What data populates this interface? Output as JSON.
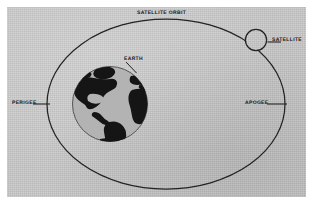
{
  "figure": {
    "title": "SATELLITE ORBIT",
    "type": "orbital-mechanics-diagram",
    "page_background": "#ffffff",
    "panel_background": "#c9c9c9",
    "ink_color": "#1b1b1b"
  },
  "labels": {
    "orbit": "SATELLITE ORBIT",
    "satellite": "SATELLITE",
    "apogee": "APOGEE",
    "perigee": "PERIGEE",
    "earth": "EARTH"
  },
  "elements": {
    "orbit_path": {
      "shape": "ellipse",
      "center_x": 166,
      "center_y": 104,
      "radius_x": 119,
      "radius_y": 85,
      "stroke": "#232323",
      "stroke_width": 1.2
    },
    "earth": {
      "shape": "circle",
      "center_x": 110,
      "center_y": 104,
      "radius": 38,
      "ocean_fill": "#b4b4b4",
      "land_fill": "#141414",
      "stroke": "#4a4a4a"
    },
    "satellite": {
      "shape": "circle",
      "center_x": 256,
      "center_y": 40,
      "radius": 11,
      "fill": "none",
      "stroke": "#232323"
    },
    "perigee_point": {
      "x": 47,
      "y": 104
    },
    "apogee_point": {
      "x": 285,
      "y": 104
    }
  },
  "leader_lines": {
    "satellite": {
      "x1": 267,
      "y1": 42,
      "x2": 281,
      "y2": 42
    },
    "apogee": {
      "x1": 267,
      "y1": 104,
      "x2": 288,
      "y2": 104
    },
    "perigee": {
      "x1": 33,
      "y1": 104,
      "x2": 50,
      "y2": 104
    },
    "earth": {
      "x1": 127,
      "y1": 62,
      "x2": 136,
      "y2": 72
    }
  }
}
